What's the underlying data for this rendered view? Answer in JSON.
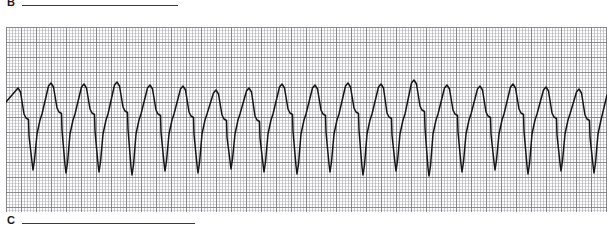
{
  "figure": {
    "panel_b": {
      "letter": "B",
      "rule": true
    },
    "panel_c": {
      "letter": "C",
      "rule": true
    }
  },
  "chart_data": {
    "type": "line",
    "title": "",
    "xlabel": "",
    "ylabel": "",
    "grid": true,
    "legend_position": "none",
    "paper": {
      "x": 6,
      "y": 27,
      "width": 601,
      "height": 185,
      "minor_cell_px": 3,
      "major_cell_px": 15,
      "minor_grid_color": "#a8a8af",
      "major_grid_color": "#78787d",
      "background_color": "#fdfdfd"
    },
    "trace": {
      "name": "ECG rhythm strip",
      "stroke_color": "#151515",
      "stroke_width": 1.5,
      "baseline_y": 118,
      "beat_count": 18,
      "beat_period_px": 33,
      "first_peak_x": 12,
      "r_peak_y": 84,
      "notch_y": 112,
      "s_nadir_y": 172,
      "morphology": "wide-complex: steep upstroke to rounded R peak, notched shoulder on descent, gradual downslope, sharp deep narrow S nadir, steep return upstroke",
      "beats": [
        {
          "index": 1,
          "peak_x": 12,
          "peak_y": 88,
          "notch_y": 118,
          "nadir_x": 27,
          "nadir_y": 170
        },
        {
          "index": 2,
          "peak_x": 45,
          "peak_y": 83,
          "notch_y": 112,
          "nadir_x": 60,
          "nadir_y": 173
        },
        {
          "index": 3,
          "peak_x": 78,
          "peak_y": 84,
          "notch_y": 113,
          "nadir_x": 93,
          "nadir_y": 172
        },
        {
          "index": 4,
          "peak_x": 111,
          "peak_y": 82,
          "notch_y": 111,
          "nadir_x": 126,
          "nadir_y": 175
        },
        {
          "index": 5,
          "peak_x": 144,
          "peak_y": 85,
          "notch_y": 114,
          "nadir_x": 159,
          "nadir_y": 171
        },
        {
          "index": 6,
          "peak_x": 177,
          "peak_y": 86,
          "notch_y": 116,
          "nadir_x": 192,
          "nadir_y": 173
        },
        {
          "index": 7,
          "peak_x": 210,
          "peak_y": 90,
          "notch_y": 119,
          "nadir_x": 225,
          "nadir_y": 169
        },
        {
          "index": 8,
          "peak_x": 243,
          "peak_y": 88,
          "notch_y": 120,
          "nadir_x": 258,
          "nadir_y": 172
        },
        {
          "index": 9,
          "peak_x": 276,
          "peak_y": 84,
          "notch_y": 113,
          "nadir_x": 291,
          "nadir_y": 174
        },
        {
          "index": 10,
          "peak_x": 309,
          "peak_y": 85,
          "notch_y": 114,
          "nadir_x": 324,
          "nadir_y": 172
        },
        {
          "index": 11,
          "peak_x": 342,
          "peak_y": 83,
          "notch_y": 112,
          "nadir_x": 357,
          "nadir_y": 175
        },
        {
          "index": 12,
          "peak_x": 375,
          "peak_y": 84,
          "notch_y": 117,
          "nadir_x": 390,
          "nadir_y": 171
        },
        {
          "index": 13,
          "peak_x": 408,
          "peak_y": 80,
          "notch_y": 110,
          "nadir_x": 423,
          "nadir_y": 176
        },
        {
          "index": 14,
          "peak_x": 441,
          "peak_y": 85,
          "notch_y": 114,
          "nadir_x": 456,
          "nadir_y": 172
        },
        {
          "index": 15,
          "peak_x": 474,
          "peak_y": 86,
          "notch_y": 116,
          "nadir_x": 489,
          "nadir_y": 170
        },
        {
          "index": 16,
          "peak_x": 507,
          "peak_y": 84,
          "notch_y": 113,
          "nadir_x": 522,
          "nadir_y": 174
        },
        {
          "index": 17,
          "peak_x": 540,
          "peak_y": 87,
          "notch_y": 117,
          "nadir_x": 555,
          "nadir_y": 171
        },
        {
          "index": 18,
          "peak_x": 573,
          "peak_y": 89,
          "notch_y": 119,
          "nadir_x": 588,
          "nadir_y": 173
        }
      ]
    }
  }
}
